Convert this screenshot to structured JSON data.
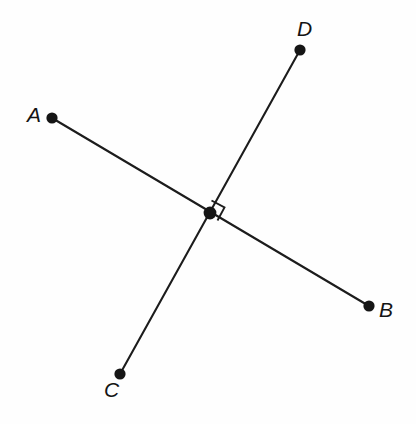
{
  "figure": {
    "background_color": "#fefefe",
    "stroke_color": "#1c1c1c",
    "dot_color": "#151515",
    "width": 416,
    "height": 424
  },
  "chart_data": {
    "type": "diagram",
    "title": "",
    "points": [
      {
        "id": "A",
        "label": "A",
        "x": 52,
        "y": 118,
        "label_x": 27,
        "label_y": 104
      },
      {
        "id": "B",
        "label": "B",
        "x": 369,
        "y": 306,
        "label_x": 379,
        "label_y": 299
      },
      {
        "id": "C",
        "label": "C",
        "x": 120,
        "y": 374,
        "label_x": 104,
        "label_y": 379
      },
      {
        "id": "D",
        "label": "D",
        "x": 300,
        "y": 50,
        "label_x": 297,
        "label_y": 18
      }
    ],
    "intersection": {
      "id": "P",
      "x": 210,
      "y": 213,
      "label": ""
    },
    "segments": [
      {
        "id": "AB",
        "from": "A",
        "to": "B",
        "through": "P"
      },
      {
        "id": "CD",
        "from": "C",
        "to": "D",
        "through": "P"
      }
    ],
    "angle_markers": [
      {
        "id": "right-angle-at-P",
        "type": "right-angle",
        "degrees": 90,
        "vertex": "P",
        "between": [
          "P-D",
          "P-B"
        ],
        "path": "M 211.5 200.5 L 224.5 207.5 L 217.5 220.5"
      }
    ],
    "annotations": []
  },
  "labels": {
    "a": "A",
    "b": "B",
    "c": "C",
    "d": "D"
  }
}
